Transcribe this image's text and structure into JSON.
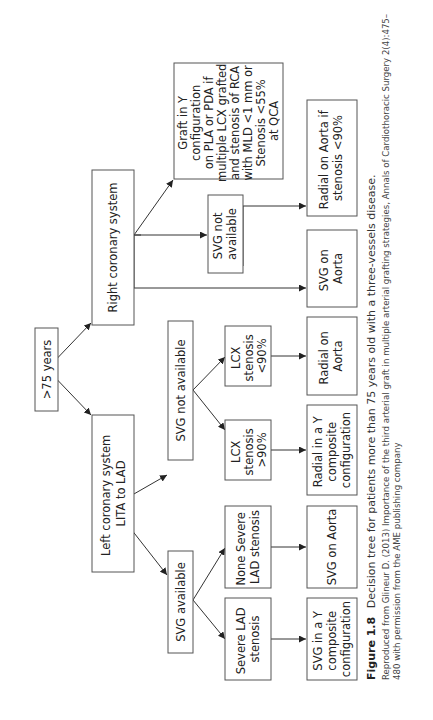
{
  "diagram": {
    "nodes": {
      "root": {
        "lines": [
          ">75 years"
        ]
      },
      "right_coronary": {
        "lines": [
          "Right coronary system"
        ]
      },
      "left_coronary": {
        "lines": [
          "Left coronary system",
          "LITA to LAD"
        ]
      },
      "left_svg_not_available": {
        "lines": [
          "SVG not available"
        ]
      },
      "left_svg_available": {
        "lines": [
          "SVG available"
        ]
      },
      "lcx_lt90": {
        "lines": [
          "LCX",
          "stenosis",
          "<90%"
        ]
      },
      "lcx_gt90": {
        "lines": [
          "LCX",
          "stenosis",
          ">90%"
        ]
      },
      "none_severe_lad": {
        "lines": [
          "None Severe",
          "LAD stenosis"
        ]
      },
      "severe_lad": {
        "lines": [
          "Severe LAD",
          "stenosis"
        ]
      },
      "right_svg_not_available": {
        "lines": [
          "SVG not",
          "available"
        ]
      },
      "graft_in_y": {
        "lines": [
          "Graft in Y",
          "configuration",
          "on PLA or PDA if",
          "multiple LCX grafted",
          "and stenosis of RCA",
          "with MLD <1 mm or",
          "Stenosis <55%",
          "at QCA"
        ]
      },
      "radial_aorta_if": {
        "lines": [
          "Radial on Aorta if",
          "stenosis <90%"
        ]
      },
      "right_svg_on_aorta": {
        "lines": [
          "SVG on",
          "Aorta"
        ]
      },
      "left_radial_on_aorta": {
        "lines": [
          "Radial on",
          "Aorta"
        ]
      },
      "radial_in_y": {
        "lines": [
          "Radial in a Y",
          "composite",
          "configuration"
        ]
      },
      "left_svg_on_aorta": {
        "lines": [
          "SVG on Aorta"
        ]
      },
      "svg_in_y": {
        "lines": [
          "SVG in a Y",
          "composite",
          "configuration"
        ]
      }
    },
    "edges": [
      [
        "root",
        "right_coronary"
      ],
      [
        "root",
        "left_coronary"
      ],
      [
        "right_coronary",
        "graft_in_y"
      ],
      [
        "right_coronary",
        "right_svg_not_available"
      ],
      [
        "right_coronary",
        "right_svg_on_aorta"
      ],
      [
        "right_svg_not_available",
        "radial_aorta_if"
      ],
      [
        "left_coronary",
        "left_svg_not_available"
      ],
      [
        "left_coronary",
        "left_svg_available"
      ],
      [
        "left_svg_not_available",
        "lcx_lt90"
      ],
      [
        "left_svg_not_available",
        "lcx_gt90"
      ],
      [
        "left_svg_available",
        "none_severe_lad"
      ],
      [
        "left_svg_available",
        "severe_lad"
      ],
      [
        "lcx_lt90",
        "left_radial_on_aorta"
      ],
      [
        "lcx_gt90",
        "radial_in_y"
      ],
      [
        "none_severe_lad",
        "left_svg_on_aorta"
      ],
      [
        "severe_lad",
        "svg_in_y"
      ]
    ]
  },
  "caption": {
    "figure_label": "Figure 1.8",
    "title": "Decision tree for patients more than 75 years old with a three-vessels disease.",
    "source_line1": "Reproduced from Glineur D. (2013) Importance of the third arterial graft in multiple arterial grafting strategies, Annals of Cardiothoracic Surgery 2(4):475–",
    "source_line2": "480 with permission from the AME publishing company"
  }
}
